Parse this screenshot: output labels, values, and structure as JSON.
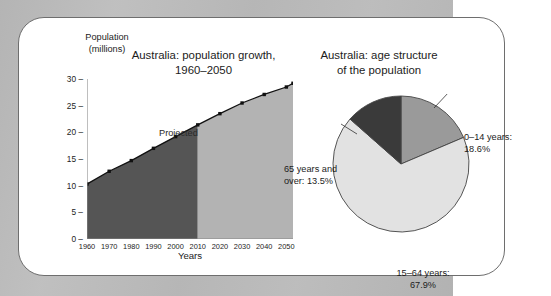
{
  "figure": {
    "background_color": "#b9b9b9",
    "card_color": "#ffffff",
    "border_color": "#6e6e6e"
  },
  "line_chart": {
    "title_line1": "Australia: population growth,",
    "title_line2": "1960–2050",
    "y_axis_label_line1": "Population",
    "y_axis_label_line2": "(millions)",
    "x_axis_title": "Years",
    "projected_label": "Projected",
    "historical_color": "#555555",
    "projected_color": "#b3b3b3",
    "line_color": "#111111"
  },
  "pie_chart": {
    "title_line1": "Australia: age structure",
    "title_line2": "of the population"
  },
  "chart_data": [
    {
      "type": "area",
      "title": "Australia: population growth, 1960–2050",
      "xlabel": "Years",
      "ylabel": "Population (millions)",
      "xlim": [
        1960,
        2053
      ],
      "ylim": [
        0,
        30
      ],
      "yticks": [
        0,
        5,
        10,
        15,
        20,
        25,
        30
      ],
      "xticks": [
        1960,
        1970,
        1980,
        1990,
        2000,
        2010,
        2020,
        2030,
        2040,
        2050
      ],
      "grid": false,
      "legend": "none",
      "annotations": [
        "Projected"
      ],
      "split_year": 2010,
      "x": [
        1960,
        1970,
        1980,
        1990,
        2000,
        2010,
        2020,
        2030,
        2040,
        2050,
        2053
      ],
      "values": [
        10.3,
        12.7,
        14.7,
        17.0,
        19.2,
        21.4,
        23.5,
        25.5,
        27.1,
        28.5,
        29.2
      ],
      "series": [
        {
          "name": "Observed",
          "x": [
            1960,
            1970,
            1980,
            1990,
            2000,
            2010
          ],
          "values": [
            10.3,
            12.7,
            14.7,
            17.0,
            19.2,
            21.4
          ]
        },
        {
          "name": "Projected",
          "x": [
            2010,
            2020,
            2030,
            2040,
            2050,
            2053
          ],
          "values": [
            21.4,
            23.5,
            25.5,
            27.1,
            28.5,
            29.2
          ]
        }
      ]
    },
    {
      "type": "pie",
      "title": "Australia: age structure of the population",
      "legend": "labels",
      "start_angle_deg": 0,
      "labels": [
        "0–14 years:",
        "15–64 years:",
        "65 years and over:"
      ],
      "categories": [
        "0–14 years",
        "15–64 years",
        "65 years and over"
      ],
      "values": [
        18.6,
        67.9,
        13.5
      ],
      "value_labels": [
        "18.6%",
        "67.9%",
        "13.5%"
      ],
      "label_lines": [
        [
          "0–14 years:",
          "18.6%"
        ],
        [
          "15–64 years:",
          "67.9%"
        ],
        [
          "65 years and",
          "over: 13.5%"
        ]
      ],
      "colors": [
        "#9a9a9a",
        "#e2e2e2",
        "#3a3a3a"
      ]
    }
  ]
}
